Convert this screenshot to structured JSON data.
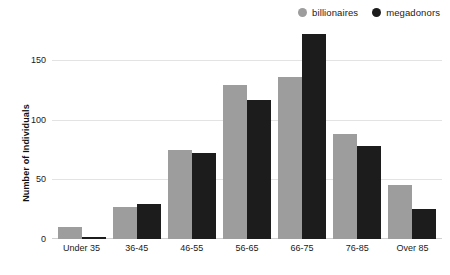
{
  "chart_data": {
    "type": "bar",
    "title": "",
    "xlabel": "",
    "ylabel": "Number of Individuals",
    "categories": [
      "Under 35",
      "36-45",
      "46-55",
      "56-65",
      "66-75",
      "76-85",
      "Over 85"
    ],
    "series": [
      {
        "name": "billionaires",
        "color": "#9d9d9d",
        "values": [
          10,
          27,
          75,
          129,
          136,
          88,
          45
        ]
      },
      {
        "name": "megadonors",
        "color": "#1c1c1c",
        "values": [
          2,
          29,
          72,
          117,
          172,
          78,
          25
        ]
      }
    ],
    "ylim": [
      0,
      182
    ],
    "yticks": [
      0,
      50,
      100,
      150
    ],
    "ytick_labels": [
      "0",
      "50",
      "100",
      "150"
    ],
    "grid": true,
    "legend_position": "top-right"
  },
  "legend": {
    "entries": [
      {
        "label": "billionaires",
        "swatch_icon": "circle-icon",
        "color": "#9d9d9d"
      },
      {
        "label": "megadonors",
        "swatch_icon": "circle-icon",
        "color": "#1c1c1c"
      }
    ]
  }
}
